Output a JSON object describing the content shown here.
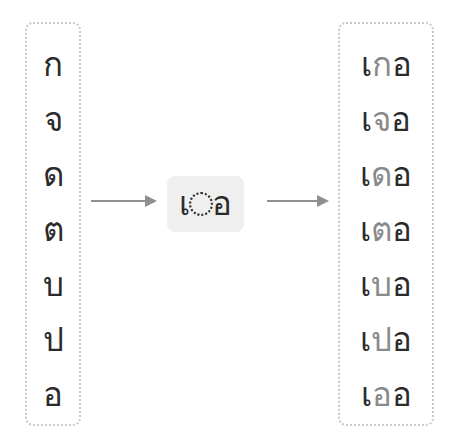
{
  "diagram": {
    "type": "thai-vowel-composition",
    "pattern": {
      "prefix": "เ",
      "placeholder": "◌",
      "suffix": "อ"
    },
    "consonants": [
      "ก",
      "จ",
      "ด",
      "ต",
      "บ",
      "ป",
      "อ"
    ],
    "results": [
      {
        "pre": "เ",
        "cons": "ก",
        "post": "อ"
      },
      {
        "pre": "เ",
        "cons": "จ",
        "post": "อ"
      },
      {
        "pre": "เ",
        "cons": "ด",
        "post": "อ"
      },
      {
        "pre": "เ",
        "cons": "ต",
        "post": "อ"
      },
      {
        "pre": "เ",
        "cons": "บ",
        "post": "อ"
      },
      {
        "pre": "เ",
        "cons": "ป",
        "post": "อ"
      },
      {
        "pre": "เ",
        "cons": "อ",
        "post": "อ"
      }
    ],
    "colors": {
      "text": "#2b2b2b",
      "highlight": "#8a8a8a",
      "box": "#efefef",
      "arrow": "#8f8f8f",
      "border": "#c8c8c8"
    }
  }
}
